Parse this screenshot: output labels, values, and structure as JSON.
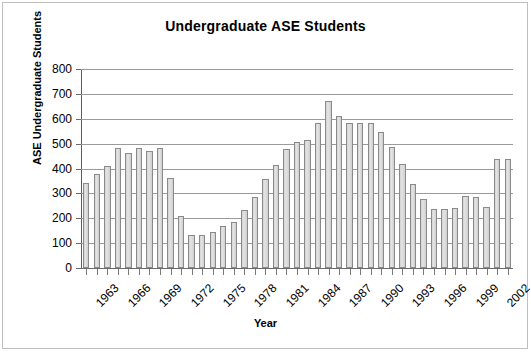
{
  "chart_data": {
    "type": "bar",
    "title": "Undergraduate ASE Students",
    "xlabel": "Year",
    "ylabel": "ASE Undergraduate Students",
    "ylim": [
      0,
      800
    ],
    "ytick_step": 100,
    "yticks": [
      0,
      100,
      200,
      300,
      400,
      500,
      600,
      700,
      800
    ],
    "grid": true,
    "legend": "none",
    "xtick_labels_every": 3,
    "xtick_label_rotation": -45,
    "bar_fill_color": "#d9d9d9",
    "bar_edge_color": "#8a8a8a",
    "categories": [
      "1963",
      "1964",
      "1965",
      "1966",
      "1967",
      "1968",
      "1969",
      "1970",
      "1971",
      "1972",
      "1973",
      "1974",
      "1975",
      "1976",
      "1977",
      "1978",
      "1979",
      "1980",
      "1981",
      "1982",
      "1983",
      "1984",
      "1985",
      "1986",
      "1987",
      "1988",
      "1989",
      "1990",
      "1991",
      "1992",
      "1993",
      "1994",
      "1995",
      "1996",
      "1997",
      "1998",
      "1999",
      "2000",
      "2001",
      "2002",
      "2003"
    ],
    "values": [
      340,
      378,
      410,
      481,
      461,
      481,
      470,
      481,
      360,
      211,
      133,
      134,
      145,
      169,
      184,
      232,
      285,
      356,
      415,
      477,
      506,
      514,
      583,
      673,
      611,
      583,
      583,
      583,
      547,
      486,
      418,
      338,
      277,
      236,
      236,
      243,
      291,
      287,
      245,
      438,
      440
    ],
    "labeled_ticks": [
      "1963",
      "1966",
      "1969",
      "1972",
      "1975",
      "1978",
      "1981",
      "1984",
      "1987",
      "1990",
      "1993",
      "1996",
      "1999",
      "2002"
    ]
  }
}
